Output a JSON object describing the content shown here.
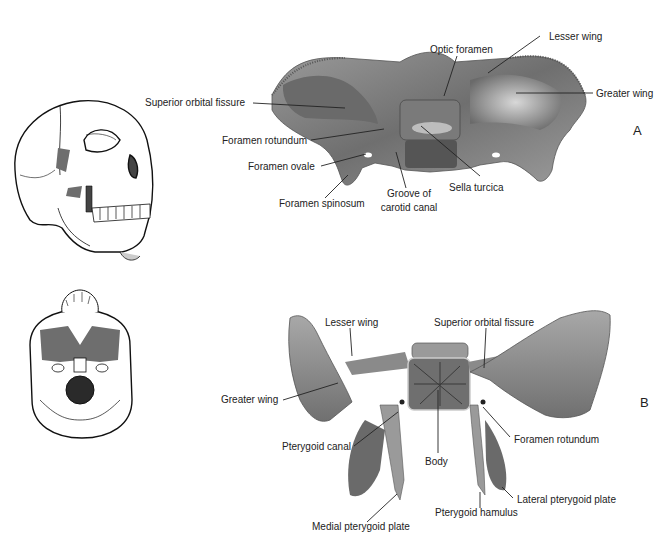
{
  "figure": {
    "panel_a": {
      "letter": "A",
      "labels": {
        "superior_orbital_fissure": "Superior orbital fissure",
        "optic_foramen": "Optic foramen",
        "lesser_wing": "Lesser wing",
        "greater_wing": "Greater wing",
        "foramen_rotundum": "Foramen rotundum",
        "foramen_ovale": "Foramen ovale",
        "foramen_spinosum": "Foramen spinosum",
        "groove_of_carotid_canal_line1": "Groove of",
        "groove_of_carotid_canal_line2": "carotid canal",
        "sella_turcica": "Sella turcica"
      }
    },
    "panel_b": {
      "letter": "B",
      "labels": {
        "lesser_wing": "Lesser wing",
        "superior_orbital_fissure": "Superior orbital fissure",
        "greater_wing": "Greater wing",
        "pterygoid_canal": "Pterygoid canal",
        "body": "Body",
        "foramen_rotundum": "Foramen rotundum",
        "lateral_pterygoid_plate": "Lateral pterygoid plate",
        "pterygoid_hamulus": "Pterygoid hamulus",
        "medial_pterygoid_plate": "Medial pterygoid plate"
      }
    },
    "highlight_color": "#6e6e6e",
    "bone_color": "#8a8a8a"
  }
}
